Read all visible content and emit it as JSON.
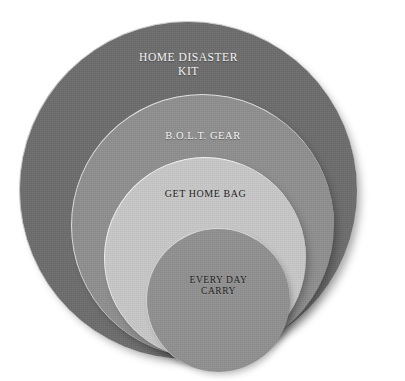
{
  "diagram": {
    "type": "nested-concentric-circles",
    "background_color": "#ffffff",
    "tiers": [
      {
        "id": "home-disaster-kit",
        "label": "HOME DISASTER\nKIT",
        "level": 1,
        "scope": "outermost",
        "fill_color": "#6e6e6e",
        "text_color": "#f4f4f4",
        "rim_color": "#cfcfcf"
      },
      {
        "id": "bolt-gear",
        "label": "B.O.L.T. GEAR",
        "level": 2,
        "scope": "second",
        "fill_color": "#909090",
        "text_color": "#f4f4f4",
        "rim_color": "#e3e3e3"
      },
      {
        "id": "get-home-bag",
        "label": "GET HOME BAG",
        "level": 3,
        "scope": "third",
        "fill_color": "#c8c8c8",
        "text_color": "#1e1e1e",
        "rim_color": "#f2f2f2"
      },
      {
        "id": "every-day-carry",
        "label": "EVERY DAY\nCARRY",
        "level": 4,
        "scope": "innermost",
        "fill_color": "#919191",
        "text_color": "#1e1e1e",
        "rim_color": "#dcdcdc"
      }
    ]
  }
}
